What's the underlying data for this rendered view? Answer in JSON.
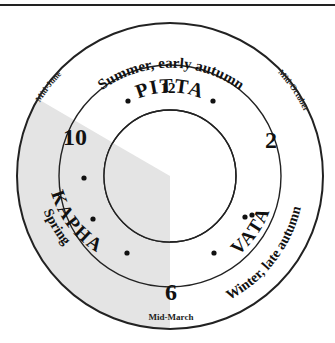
{
  "diagram": {
    "colors": {
      "line": "#222222",
      "shade": "#e4e4e4",
      "text": "#111111",
      "background": "#ffffff"
    },
    "doshas": {
      "pitta": "PITTA",
      "kapha": "KAPHA",
      "vata": "VATA"
    },
    "seasons": {
      "pitta": "Summer, early autumn",
      "kapha": "Spring",
      "vata": "Winter, late autumn"
    },
    "boundaries": {
      "june": "Mid-June",
      "october": "Mid-October",
      "march": "Mid-March"
    },
    "hours": {
      "twelve": "12",
      "two": "2",
      "six": "6",
      "ten": "10"
    }
  }
}
